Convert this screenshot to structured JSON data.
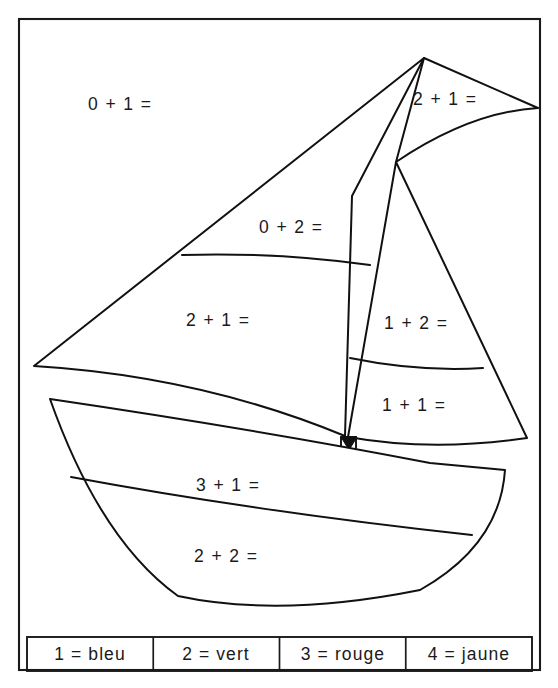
{
  "page": {
    "background_color": "#ffffff",
    "ink_color": "#111111"
  },
  "frame": {
    "name": "outer-border"
  },
  "figure": {
    "parts": [
      {
        "id": "sky",
        "name": "background-sky-region",
        "label": "0 + 1 =",
        "label_x": 88,
        "label_y": 105
      },
      {
        "id": "pennant",
        "name": "pennant-sail-region",
        "label": "2 + 1 =",
        "label_x": 413,
        "label_y": 100
      },
      {
        "id": "mainsail-upper",
        "name": "mainsail-upper-region",
        "label": "0 + 2 =",
        "label_x": 259,
        "label_y": 228
      },
      {
        "id": "mainsail-lower",
        "name": "mainsail-lower-region",
        "label": "2 + 1 =",
        "label_x": 186,
        "label_y": 321
      },
      {
        "id": "jib-upper",
        "name": "jib-upper-region",
        "label": "1 + 2 =",
        "label_x": 384,
        "label_y": 324
      },
      {
        "id": "jib-lower",
        "name": "jib-lower-region",
        "label": "1 + 1 =",
        "label_x": 382,
        "label_y": 406
      },
      {
        "id": "hull-upper",
        "name": "hull-upper-region",
        "label": "3 + 1 =",
        "label_x": 196,
        "label_y": 486
      },
      {
        "id": "hull-lower",
        "name": "hull-lower-region",
        "label": "2 + 2 =",
        "label_x": 194,
        "label_y": 557
      }
    ]
  },
  "legend": {
    "name": "color-key",
    "cells": [
      {
        "id": "key-1",
        "text": "1 = bleu",
        "number": "1",
        "color_name": "bleu",
        "color_hex": "#1b55c4"
      },
      {
        "id": "key-2",
        "text": "2 = vert",
        "number": "2",
        "color_name": "vert",
        "color_hex": "#1f9e3e"
      },
      {
        "id": "key-3",
        "text": "3 = rouge",
        "number": "3",
        "color_name": "rouge",
        "color_hex": "#d62626"
      },
      {
        "id": "key-4",
        "text": "4 = jaune",
        "number": "4",
        "color_name": "jaune",
        "color_hex": "#f2d218"
      }
    ]
  }
}
